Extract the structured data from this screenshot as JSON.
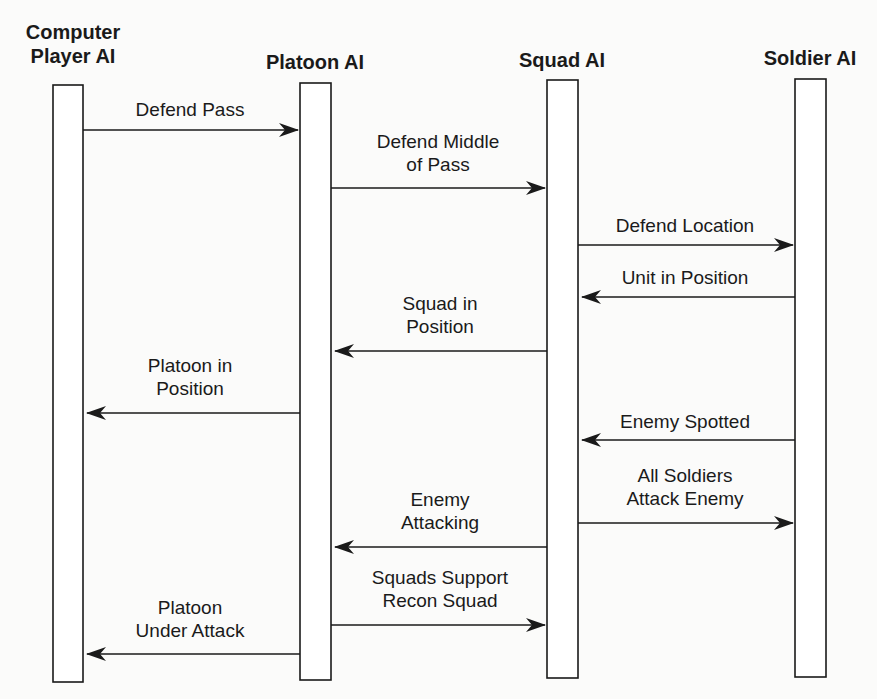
{
  "diagram": {
    "type": "sequence",
    "lifelines": [
      {
        "id": "computer",
        "label": "Computer\nPlayer AI",
        "x": 53,
        "y": 85,
        "w": 30,
        "h": 597,
        "lx": 8,
        "ly": 20,
        "lw": 130
      },
      {
        "id": "platoon",
        "label": "Platoon AI",
        "x": 300,
        "y": 83,
        "w": 31,
        "h": 597,
        "lx": 245,
        "ly": 50,
        "lw": 140
      },
      {
        "id": "squad",
        "label": "Squad AI",
        "x": 547,
        "y": 80,
        "w": 31,
        "h": 598,
        "lx": 492,
        "ly": 48,
        "lw": 140
      },
      {
        "id": "soldier",
        "label": "Soldier AI",
        "x": 795,
        "y": 79,
        "w": 31,
        "h": 598,
        "lx": 740,
        "ly": 46,
        "lw": 140
      }
    ],
    "messages": [
      {
        "label": "Defend Pass",
        "from": "computer",
        "to": "platoon",
        "x1": 83,
        "x2": 298,
        "y": 130,
        "lx": 110,
        "ly": 98,
        "lw": 160
      },
      {
        "label": "Defend Middle\nof Pass",
        "from": "platoon",
        "to": "squad",
        "x1": 331,
        "x2": 545,
        "y": 188,
        "lx": 348,
        "ly": 130,
        "lw": 180
      },
      {
        "label": "Defend Location",
        "from": "squad",
        "to": "soldier",
        "x1": 578,
        "x2": 793,
        "y": 245,
        "lx": 585,
        "ly": 214,
        "lw": 200
      },
      {
        "label": "Unit in Position",
        "from": "soldier",
        "to": "squad",
        "x1": 795,
        "x2": 582,
        "y": 297,
        "lx": 585,
        "ly": 266,
        "lw": 200
      },
      {
        "label": "Squad in\nPosition",
        "from": "squad",
        "to": "platoon",
        "x1": 547,
        "x2": 335,
        "y": 351,
        "lx": 360,
        "ly": 292,
        "lw": 160
      },
      {
        "label": "Platoon in\nPosition",
        "from": "platoon",
        "to": "computer",
        "x1": 300,
        "x2": 87,
        "y": 413,
        "lx": 110,
        "ly": 354,
        "lw": 160
      },
      {
        "label": "Enemy Spotted",
        "from": "soldier",
        "to": "squad",
        "x1": 795,
        "x2": 582,
        "y": 440,
        "lx": 585,
        "ly": 410,
        "lw": 200
      },
      {
        "label": "All Soldiers\nAttack Enemy",
        "from": "squad",
        "to": "soldier",
        "x1": 578,
        "x2": 793,
        "y": 523,
        "lx": 585,
        "ly": 464,
        "lw": 200
      },
      {
        "label": "Enemy\nAttacking",
        "from": "squad",
        "to": "platoon",
        "x1": 547,
        "x2": 335,
        "y": 547,
        "lx": 360,
        "ly": 488,
        "lw": 160
      },
      {
        "label": "Squads Support\nRecon Squad",
        "from": "platoon",
        "to": "squad",
        "x1": 331,
        "x2": 545,
        "y": 625,
        "lx": 340,
        "ly": 566,
        "lw": 200
      },
      {
        "label": "Platoon\nUnder Attack",
        "from": "platoon",
        "to": "computer",
        "x1": 300,
        "x2": 87,
        "y": 654,
        "lx": 110,
        "ly": 596,
        "lw": 160
      }
    ],
    "colors": {
      "stroke": "#1a1a1a",
      "background": "#fbfbfa",
      "box_fill": "#ffffff"
    }
  }
}
